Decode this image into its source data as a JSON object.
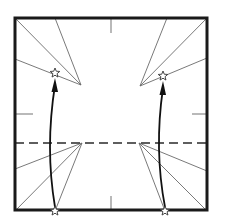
{
  "diagram": {
    "type": "origami-fold-step",
    "colors": {
      "paper_edge": "#1a1a1a",
      "crease": "#6a6a6a",
      "valley_fold": "#2a2a2a",
      "arrow": "#111111",
      "star_fill": "#ffffff"
    },
    "square": {
      "x": 15,
      "y": 18,
      "size": 192
    },
    "reference_ticks": [
      {
        "name": "top-midpoint",
        "x1": 111,
        "y1": 18,
        "x2": 111,
        "y2": 33
      },
      {
        "name": "left-midpoint",
        "x1": 15,
        "y1": 114,
        "x2": 33,
        "y2": 114
      },
      {
        "name": "right-midpoint",
        "x1": 192,
        "y1": 114,
        "x2": 207,
        "y2": 114
      },
      {
        "name": "bottom-midpoint",
        "x1": 111,
        "y1": 196,
        "x2": 111,
        "y2": 211
      }
    ],
    "valley_fold_line": {
      "x1": 15,
      "y1": 143,
      "x2": 207,
      "y2": 143
    },
    "crease_fans": [
      {
        "name": "upper-left",
        "apex": [
          81,
          85
        ],
        "targets": [
          [
            15,
            18
          ],
          [
            55,
            18
          ],
          [
            15,
            59
          ]
        ]
      },
      {
        "name": "upper-right",
        "apex": [
          140,
          86
        ],
        "targets": [
          [
            207,
            18
          ],
          [
            167,
            18
          ],
          [
            207,
            58
          ]
        ]
      },
      {
        "name": "lower-left",
        "apex": [
          82,
          143
        ],
        "targets": [
          [
            15,
            211
          ],
          [
            55,
            211
          ],
          [
            15,
            169
          ]
        ]
      },
      {
        "name": "lower-right",
        "apex": [
          139,
          143
        ],
        "targets": [
          [
            207,
            211
          ],
          [
            165,
            211
          ],
          [
            207,
            171
          ]
        ]
      }
    ],
    "arrows": [
      {
        "name": "left-fold-arrow",
        "from": [
          55,
          211
        ],
        "to": [
          55,
          73
        ],
        "bulge": -10
      },
      {
        "name": "right-fold-arrow",
        "from": [
          165,
          211
        ],
        "to": [
          163,
          76
        ],
        "bulge": -10
      }
    ],
    "stars": [
      {
        "name": "star-upper-left",
        "x": 55,
        "y": 73
      },
      {
        "name": "star-upper-right",
        "x": 163,
        "y": 76
      },
      {
        "name": "star-lower-left",
        "x": 55,
        "y": 211
      },
      {
        "name": "star-lower-right",
        "x": 165,
        "y": 211
      }
    ]
  }
}
